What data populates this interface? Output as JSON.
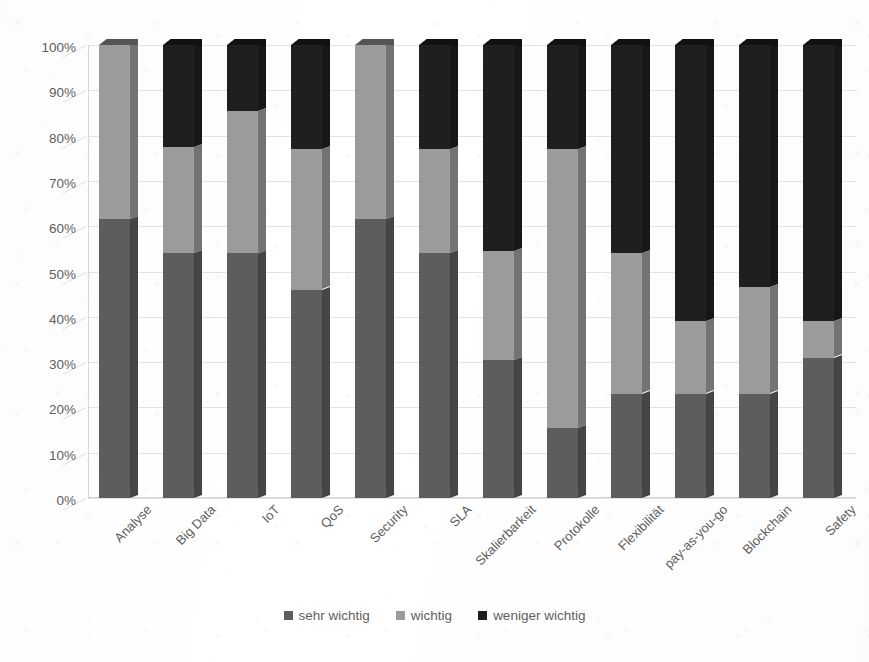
{
  "chart_data": {
    "type": "bar",
    "subtype": "stacked-100-percent-3d",
    "title": "",
    "xlabel": "",
    "ylabel": "",
    "ylim": [
      0,
      100
    ],
    "ytick_labels": [
      "0%",
      "10%",
      "20%",
      "30%",
      "40%",
      "50%",
      "60%",
      "70%",
      "80%",
      "90%",
      "100%"
    ],
    "ytick_values": [
      0,
      10,
      20,
      30,
      40,
      50,
      60,
      70,
      80,
      90,
      100
    ],
    "grid": true,
    "legend_position": "bottom",
    "categories": [
      "Analyse",
      "Big Data",
      "IoT",
      "QoS",
      "Security",
      "SLA",
      "Skalierbarkeit",
      "Protokolle",
      "Flexibilität",
      "pay-as-you-go",
      "Blockchain",
      "Safety"
    ],
    "series": [
      {
        "name": "sehr wichtig",
        "color": "#5d5d5d",
        "values": [
          61.5,
          54,
          54,
          46,
          61.5,
          54,
          30.5,
          15.5,
          23,
          23,
          23,
          31
        ]
      },
      {
        "name": "wichtig",
        "color": "#9b9b9b",
        "values": [
          38.5,
          23.5,
          31.5,
          31,
          38.5,
          23,
          24,
          61.5,
          31,
          16,
          23.5,
          8
        ]
      },
      {
        "name": "weniger wichtig",
        "color": "#1f1f1f",
        "values": [
          0,
          22.5,
          14.5,
          23,
          0,
          23,
          45.5,
          23,
          46,
          61,
          53.5,
          61
        ]
      }
    ],
    "cumulative_tops": {
      "sehr wichtig": [
        61.5,
        54,
        54,
        46,
        61.5,
        54,
        30.5,
        15.5,
        23,
        23,
        23,
        31
      ],
      "wichtig": [
        100,
        77.5,
        85.5,
        77,
        100,
        77,
        54.5,
        77,
        54,
        39,
        46.5,
        39
      ],
      "weniger wichtig": [
        100,
        100,
        100,
        100,
        100,
        100,
        100,
        100,
        100,
        100,
        100,
        100
      ]
    }
  },
  "legend": {
    "items": [
      {
        "label": "sehr wichtig",
        "color": "#5d5d5d"
      },
      {
        "label": "wichtig",
        "color": "#9b9b9b"
      },
      {
        "label": "weniger wichtig",
        "color": "#1f1f1f"
      }
    ]
  },
  "axis": {
    "y_ticks": [
      "100%",
      "90%",
      "80%",
      "70%",
      "60%",
      "50%",
      "40%",
      "30%",
      "20%",
      "10%",
      "0%"
    ]
  }
}
